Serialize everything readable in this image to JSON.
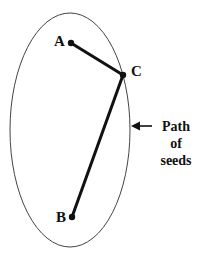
{
  "diagram": {
    "points": {
      "A": {
        "label": "A",
        "x": 71,
        "y": 43
      },
      "C": {
        "label": "C",
        "x": 123,
        "y": 75
      },
      "B": {
        "label": "B",
        "x": 72,
        "y": 217
      }
    },
    "ellipse": {
      "cx": 70,
      "cy": 130,
      "rx": 60,
      "ry": 117
    },
    "annotation": {
      "line1": "Path",
      "line2": "of",
      "line3": "seeds"
    },
    "colors": {
      "stroke": "#111111",
      "ellipse": "#444444",
      "background": "#ffffff"
    }
  }
}
